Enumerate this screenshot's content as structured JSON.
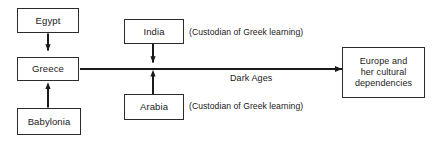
{
  "diagram": {
    "stroke_color": "#2b2b2b",
    "text_color": "#1a1a1a",
    "background_color": "#ffffff",
    "nodes": {
      "egypt": {
        "label": "Egypt"
      },
      "greece": {
        "label": "Greece"
      },
      "babylonia": {
        "label": "Babylonia"
      },
      "india": {
        "label": "India"
      },
      "arabia": {
        "label": "Arabia"
      },
      "europe": {
        "line1": "Europe and",
        "line2": "her cultural",
        "line3": "dependencies"
      }
    },
    "edge_labels": {
      "dark_ages": "Dark Ages"
    },
    "annotations": {
      "india_note": "(Custodian of Greek learning)",
      "arabia_note": "(Custodian of Greek learning)"
    }
  }
}
